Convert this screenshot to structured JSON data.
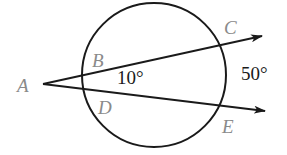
{
  "diagram": {
    "type": "circle-secants",
    "points": {
      "A": "A",
      "B": "B",
      "C": "C",
      "D": "D",
      "E": "E"
    },
    "angles": {
      "inner_arc_label": "10°",
      "outer_arc_label": "50°"
    },
    "colors": {
      "stroke": "#1a1a1a",
      "point_label": "#8a8a8a",
      "angle_label": "#1a1a1a"
    }
  }
}
